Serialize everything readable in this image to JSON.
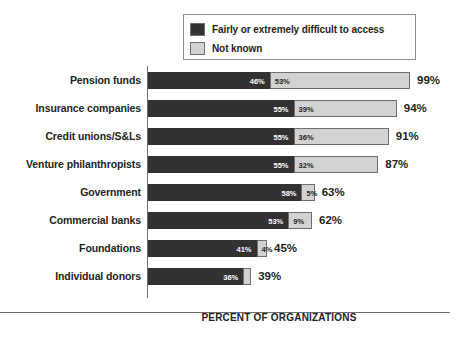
{
  "chart_data": {
    "type": "bar",
    "orientation": "horizontal",
    "stacked": true,
    "title": "",
    "xlabel": "PERCENT OF ORGANIZATIONS",
    "ylabel": "",
    "xlim": [
      0,
      99
    ],
    "grid": false,
    "legend_position": "top",
    "categories": [
      "Pension funds",
      "Insurance companies",
      "Credit unions/S&Ls",
      "Venture philanthropists",
      "Government",
      "Commercial banks",
      "Foundations",
      "Individual donors"
    ],
    "series": [
      {
        "name": "Fairly or extremely difficult to access",
        "color": "#333132",
        "values": [
          46,
          55,
          55,
          55,
          58,
          53,
          41,
          36
        ],
        "labels": [
          "46%",
          "55%",
          "55%",
          "55%",
          "58%",
          "53%",
          "41%",
          "36%"
        ]
      },
      {
        "name": "Not known",
        "color": "#d2d2d2",
        "values": [
          53,
          39,
          36,
          32,
          5,
          9,
          4,
          3
        ],
        "labels": [
          "53%",
          "39%",
          "36%",
          "32%",
          "5%",
          "9%",
          "4%",
          ""
        ]
      }
    ],
    "totals": [
      99,
      94,
      91,
      87,
      63,
      62,
      45,
      39
    ],
    "total_labels": [
      "99%",
      "94%",
      "91%",
      "87%",
      "63%",
      "62%",
      "45%",
      "39%"
    ]
  },
  "legend": {
    "items": [
      {
        "label": "Fairly or extremely difficult to access",
        "swatch": "dark"
      },
      {
        "label": "Not known",
        "swatch": "light"
      }
    ]
  },
  "colors": {
    "dark": "#333132",
    "light": "#d2d2d2",
    "outline": "#6f6f6f",
    "text": "#231f20",
    "background": "#ffffff"
  }
}
